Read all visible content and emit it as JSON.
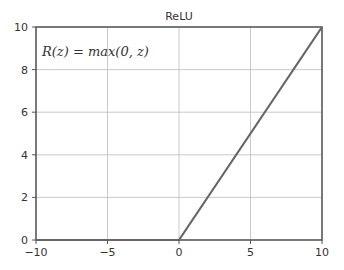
{
  "chart_data": {
    "type": "line",
    "title": "ReLU",
    "annotation": "R(z) = max(0, z)",
    "xlabel": "",
    "ylabel": "",
    "xlim": [
      -10,
      10
    ],
    "ylim": [
      0,
      10
    ],
    "xticks": [
      -10,
      -5,
      0,
      5,
      10
    ],
    "yticks": [
      0,
      2,
      4,
      6,
      8,
      10
    ],
    "xtick_labels": [
      "−10",
      "−5",
      "0",
      "5",
      "10"
    ],
    "ytick_labels": [
      "0",
      "2",
      "4",
      "6",
      "8",
      "10"
    ],
    "grid": true,
    "series": [
      {
        "name": "ReLU",
        "x": [
          -10,
          0,
          10
        ],
        "y": [
          0,
          0,
          10
        ],
        "color": "#666666"
      }
    ]
  }
}
